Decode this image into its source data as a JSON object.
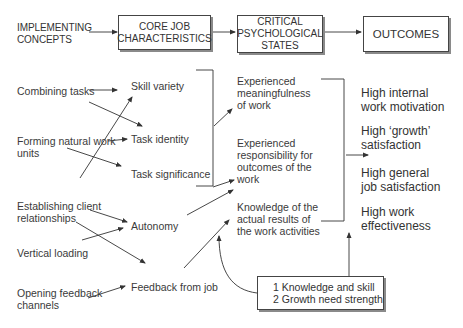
{
  "header": {
    "implementing_concepts": [
      "IMPLEMENTING",
      "CONCEPTS"
    ],
    "core_job_characteristics": [
      "CORE JOB",
      "CHARACTERISTICS"
    ],
    "critical_psychological_states": [
      "CRITICAL",
      "PSYCHOLOGICAL",
      "STATES"
    ],
    "outcomes": "OUTCOMES"
  },
  "implementing_concepts": [
    {
      "lines": [
        "Combining tasks"
      ]
    },
    {
      "lines": [
        "Forming natural work",
        "units"
      ]
    },
    {
      "lines": [
        "Establishing client",
        "relationships"
      ]
    },
    {
      "lines": [
        "Vertical loading"
      ]
    },
    {
      "lines": [
        "Opening feedback",
        "channels"
      ]
    }
  ],
  "core_job_characteristics": [
    "Skill variety",
    "Task identity",
    "Task significance",
    "Autonomy",
    "Feedback from job"
  ],
  "critical_psychological_states": [
    {
      "lines": [
        "Experienced",
        "meaningfulness",
        "of work"
      ]
    },
    {
      "lines": [
        "Experienced",
        "responsibility for",
        "outcomes of the",
        "work"
      ]
    },
    {
      "lines": [
        "Knowledge of the",
        "actual results of",
        "the work activities"
      ]
    }
  ],
  "outcomes": [
    {
      "lines": [
        "High internal",
        "work motivation"
      ]
    },
    {
      "lines": [
        "High ‘growth’",
        "satisfaction"
      ]
    },
    {
      "lines": [
        "High general",
        "job satisfaction"
      ]
    },
    {
      "lines": [
        "High work",
        "effectiveness"
      ]
    }
  ],
  "moderators": [
    "1  Knowledge and skill",
    "2  Growth need strength"
  ],
  "colors": {
    "line": "#333333",
    "box_shadow": "#8a8a8a"
  }
}
